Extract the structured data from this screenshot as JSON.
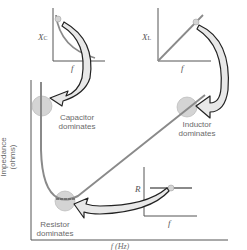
{
  "diagram": {
    "main_axes": {
      "ylabel_line1": "Impedance",
      "ylabel_line2": "(ohms)",
      "xlabel": "f (Hz)"
    },
    "regions": [
      {
        "id": "capacitor",
        "label_line1": "Capacitor",
        "label_line2": "dominates"
      },
      {
        "id": "inductor",
        "label_line1": "Inductor",
        "label_line2": "dominates"
      },
      {
        "id": "resistor",
        "label_line1": "Resistor",
        "label_line2": "dominates"
      }
    ],
    "insets": [
      {
        "id": "capacitor-inset",
        "ylabel": "X",
        "ylabel_sub": "C",
        "xlabel": "f"
      },
      {
        "id": "inductor-inset",
        "ylabel": "X",
        "ylabel_sub": "L",
        "xlabel": "f"
      },
      {
        "id": "resistor-inset",
        "ylabel": "R",
        "xlabel": "f"
      }
    ],
    "colors": {
      "curve": "#8a8a8a",
      "axis": "#555555",
      "highlight": "#d4d4d4",
      "arrow_fill": "#e8e8e8",
      "arrow_stroke": "#222222"
    }
  }
}
